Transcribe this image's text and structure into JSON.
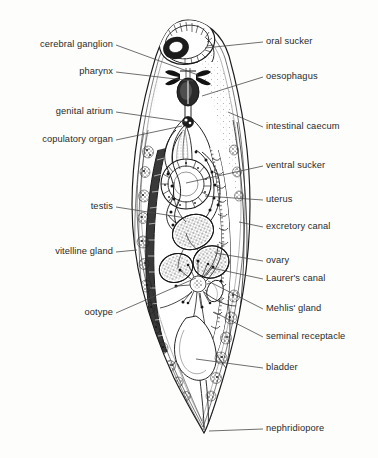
{
  "figure": {
    "organism": "digenean trematode (fluke)",
    "view": "ventral whole-mount line drawing",
    "background_color": "#fdfdfb",
    "ink_color": "#1a1a1a",
    "label_color": "#2a2a2a"
  },
  "labels_left": [
    {
      "id": "cerebral-ganglion",
      "text": "cerebral ganglion",
      "text_x": 113,
      "text_y": 45,
      "leader": "M116,45 L198,75"
    },
    {
      "id": "pharynx",
      "text": "pharynx",
      "text_x": 113,
      "text_y": 72,
      "leader": "M116,72 L193,81"
    },
    {
      "id": "genital-atrium",
      "text": "genital atrium",
      "text_x": 113,
      "text_y": 112,
      "leader": "M116,112 L186,122"
    },
    {
      "id": "copulatory-organ",
      "text": "copulatory organ",
      "text_x": 113,
      "text_y": 140,
      "leader": "M116,140 L182,126"
    },
    {
      "id": "testis",
      "text": "testis",
      "text_x": 113,
      "text_y": 207,
      "leader": "M116,207 L186,218"
    },
    {
      "id": "vitelline-gland",
      "text": "vitelline gland",
      "text_x": 113,
      "text_y": 252,
      "leader": "M116,252 L137,250"
    },
    {
      "id": "ootype",
      "text": "ootype",
      "text_x": 113,
      "text_y": 313,
      "leader": "M116,313 L196,278"
    }
  ],
  "labels_right": [
    {
      "id": "oral-sucker",
      "text": "oral sucker",
      "text_x": 266,
      "text_y": 42,
      "leader": "M263,42 L205,48"
    },
    {
      "id": "oesophagus",
      "text": "oesophagus",
      "text_x": 266,
      "text_y": 77,
      "leader": "M263,77 L202,96"
    },
    {
      "id": "intestinal-caecum",
      "text": "intestinal caecum",
      "text_x": 266,
      "text_y": 127,
      "leader": "M263,127 L228,112"
    },
    {
      "id": "ventral-sucker",
      "text": "ventral sucker",
      "text_x": 266,
      "text_y": 166,
      "leader": "M263,166 L186,183"
    },
    {
      "id": "uterus",
      "text": "uterus",
      "text_x": 266,
      "text_y": 200,
      "leader": "M263,200 L205,196"
    },
    {
      "id": "excretory-canal",
      "text": "excretory canal",
      "text_x": 266,
      "text_y": 227,
      "leader": "M263,227 L239,222"
    },
    {
      "id": "ovary",
      "text": "ovary",
      "text_x": 266,
      "text_y": 261,
      "leader": "M263,261 L215,253"
    },
    {
      "id": "laurers-canal",
      "text": "Laurer's canal",
      "text_x": 266,
      "text_y": 279,
      "leader": "M263,279 L212,268"
    },
    {
      "id": "mehlis-gland",
      "text": "Mehlis' gland",
      "text_x": 266,
      "text_y": 309,
      "leader": "M263,309 L208,281"
    },
    {
      "id": "seminal-receptacle",
      "text": "seminal receptacle",
      "text_x": 266,
      "text_y": 337,
      "leader": "M263,337 L214,312"
    },
    {
      "id": "bladder",
      "text": "bladder",
      "text_x": 266,
      "text_y": 368,
      "leader": "M263,368 L196,359"
    },
    {
      "id": "nephridiopore",
      "text": "nephridiopore",
      "text_x": 266,
      "text_y": 429,
      "leader": "M263,429 L209,431"
    }
  ]
}
